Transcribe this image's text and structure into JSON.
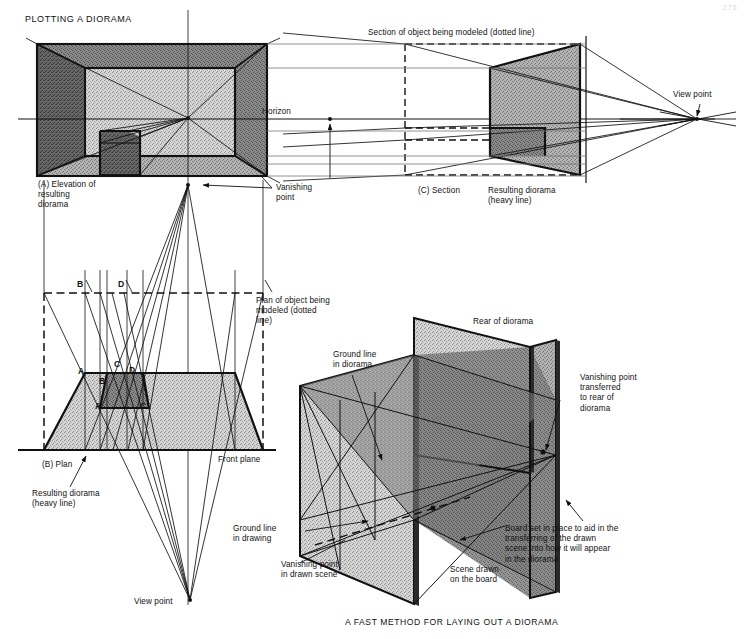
{
  "figure": {
    "title": "PLOTTING A DIORAMA",
    "caption": "A FAST METHOD FOR LAYING OUT A DIORAMA",
    "page_number": "275"
  },
  "colors": {
    "ink": "#111111",
    "paper": "#ffffff",
    "tone_light": "#c9c9c9",
    "tone_mid": "#a6a6a6",
    "tone_dark": "#7c7c7c",
    "tone_darker": "#5e5e5e",
    "hairline": "#555555"
  },
  "elevation": {
    "key": "(A) Elevation of\nresulting\ndiorama",
    "horizon_label": "Horizon",
    "vanishing_point_label": "Vanishing\npoint"
  },
  "section": {
    "key": "(C) Section",
    "object_label": "Section of object being modeled (dotted line)",
    "result_label": "Resulting diorama\n(heavy line)",
    "view_point_label": "View point"
  },
  "plan": {
    "key": "(B) Plan",
    "object_label": "Plan of object being\nmodeled (dotted\nline)",
    "result_label": "Resulting diorama\n(heavy line)",
    "front_plane_label": "Front plane",
    "view_point_label": "View point",
    "corner_labels": [
      "A",
      "B",
      "C",
      "D"
    ],
    "upper_points": [
      {
        "label": "B",
        "x": 80,
        "y": 285
      },
      {
        "label": "D",
        "x": 121,
        "y": 285
      }
    ],
    "mid_points": [
      {
        "label": "A",
        "x": 83,
        "y": 372
      },
      {
        "label": "C",
        "x": 119,
        "y": 366
      },
      {
        "label": "D",
        "x": 133,
        "y": 371
      },
      {
        "label": "B",
        "x": 100,
        "y": 382
      }
    ],
    "low_points": [
      {
        "label": "A",
        "x": 99,
        "y": 408
      },
      {
        "label": "C",
        "x": 141,
        "y": 408
      }
    ]
  },
  "perspective": {
    "rear_label": "Rear of diorama",
    "ground_line_diorama_label": "Ground line\nin diorama",
    "ground_line_drawing_label": "Ground line\nin drawing",
    "vanishing_point_drawn_label": "Vanishing point\nin drawn scene",
    "vanishing_point_rear_label": "Vanishing point\ntransferred\nto rear of\ndiorama",
    "board_label": "Board set in place to aid in the\ntransferring of the drawn\nscene into how it will appear\nin the diorama",
    "scene_label": "Scene drawn\non the board"
  }
}
